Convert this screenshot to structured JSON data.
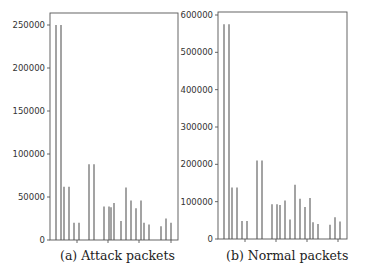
{
  "chart_data": [
    {
      "type": "bar",
      "title": "",
      "caption": "(a) Attack packets",
      "xlabel": "",
      "ylabel": "",
      "ylim": [
        0,
        265000
      ],
      "yticks": [
        0,
        50000,
        100000,
        150000,
        200000,
        250000
      ],
      "ytick_labels": [
        "0",
        "50000",
        "100000",
        "150000",
        "200000",
        "250000"
      ],
      "grid": false,
      "bar_color": "#666666",
      "bar_positions_px": [
        56,
        61,
        64,
        69,
        74,
        79,
        89,
        94,
        104,
        109,
        111,
        114,
        121,
        126,
        131,
        136,
        141,
        144,
        149,
        161,
        166,
        171
      ],
      "values": [
        250000,
        250000,
        62000,
        62000,
        20000,
        20000,
        88000,
        88000,
        39000,
        39000,
        38000,
        43000,
        22000,
        61000,
        46000,
        37000,
        46000,
        20000,
        18000,
        16000,
        25000,
        20000
      ],
      "xtick_positions_px": [
        77,
        108,
        139,
        171
      ]
    },
    {
      "type": "bar",
      "title": "",
      "caption": "(b) Normal packets",
      "xlabel": "",
      "ylabel": "",
      "ylim": [
        0,
        600000
      ],
      "yticks": [
        0,
        100000,
        200000,
        300000,
        400000,
        500000,
        600000
      ],
      "ytick_labels": [
        "0",
        "100000",
        "200000",
        "300000",
        "400000",
        "500000",
        "600000"
      ],
      "grid": false,
      "bar_color": "#666666",
      "bar_positions_px": [
        224,
        229,
        232,
        237,
        242,
        247,
        257,
        262,
        272,
        277,
        280,
        285,
        290,
        295,
        300,
        305,
        310,
        313,
        318,
        330,
        335,
        340
      ],
      "values": [
        575000,
        575000,
        138000,
        138000,
        48000,
        48000,
        210000,
        210000,
        93000,
        93000,
        91000,
        103000,
        52000,
        145000,
        108000,
        86000,
        110000,
        45000,
        40000,
        38000,
        58000,
        47000
      ],
      "xtick_positions_px": [
        245,
        276,
        307,
        338
      ]
    }
  ]
}
